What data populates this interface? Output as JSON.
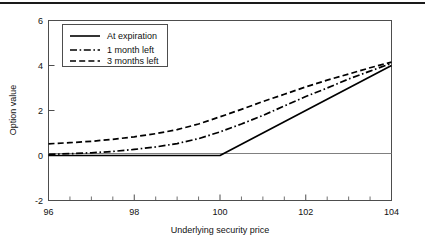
{
  "figure": {
    "top_rule": "horizontal-rule",
    "background_color": "#ffffff",
    "line_color": "#000000",
    "frame_color": "#4d4d4d",
    "zeroline_color": "#808080"
  },
  "chart_data": {
    "type": "line",
    "title": "",
    "subtitle": "",
    "xlabel": "Underlying security price",
    "ylabel": "Option value",
    "xlim": [
      96,
      104
    ],
    "ylim": [
      -2,
      6
    ],
    "xticks": [
      96,
      98,
      100,
      102,
      104
    ],
    "xticklabels": [
      "96",
      "98",
      "100",
      "102",
      "104"
    ],
    "xminor_step": 0.5,
    "yticks": [
      -2,
      0,
      2,
      4,
      6
    ],
    "yticklabels": [
      "-2",
      "0",
      "2",
      "4",
      "6"
    ],
    "grid": false,
    "zero_reference_line": 0,
    "legend_position": "upper-left",
    "x": [
      96,
      96.5,
      97,
      97.5,
      98,
      98.5,
      99,
      99.5,
      100,
      100.5,
      101,
      101.5,
      102,
      102.5,
      103,
      103.5,
      104
    ],
    "series": [
      {
        "name": "At expiration",
        "style": "solid",
        "values": [
          0,
          0,
          0,
          0,
          0,
          0,
          0,
          0,
          0,
          0.5,
          1.0,
          1.5,
          2.0,
          2.5,
          3.0,
          3.5,
          4.0
        ]
      },
      {
        "name": "1 month left",
        "style": "dash-dot",
        "values": [
          0.05,
          0.08,
          0.12,
          0.18,
          0.27,
          0.38,
          0.53,
          0.75,
          1.05,
          1.4,
          1.78,
          2.2,
          2.62,
          3.0,
          3.4,
          3.75,
          4.1
        ]
      },
      {
        "name": "3 months left",
        "style": "dashed",
        "values": [
          0.52,
          0.57,
          0.63,
          0.72,
          0.83,
          0.97,
          1.15,
          1.4,
          1.72,
          2.05,
          2.4,
          2.72,
          3.05,
          3.35,
          3.62,
          3.9,
          4.15
        ]
      }
    ]
  },
  "legend": {
    "entries": [
      {
        "label": "At expiration",
        "style": "solid"
      },
      {
        "label": "1 month left",
        "style": "dash-dot"
      },
      {
        "label": "3 months left",
        "style": "dashed"
      }
    ]
  }
}
